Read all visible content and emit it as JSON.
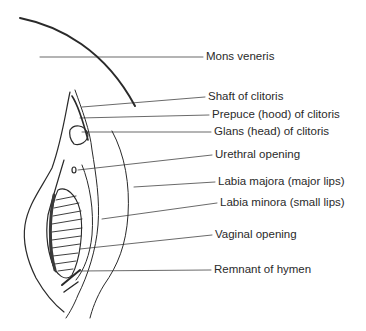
{
  "figure": {
    "type": "anatomical line drawing",
    "line_color": "#2a2a2a",
    "labels": [
      {
        "text": "Mons veneris",
        "x": 206,
        "y": 50
      },
      {
        "text": "Shaft of clitoris",
        "x": 208,
        "y": 90
      },
      {
        "text": "Prepuce (hood) of clitoris",
        "x": 212,
        "y": 108
      },
      {
        "text": "Glans (head) of clitoris",
        "x": 214,
        "y": 125
      },
      {
        "text": "Urethral opening",
        "x": 215,
        "y": 148
      },
      {
        "text": "Labia majora (major lips)",
        "x": 218,
        "y": 175
      },
      {
        "text": "Labia minora (small lips)",
        "x": 220,
        "y": 196
      },
      {
        "text": "Vaginal opening",
        "x": 215,
        "y": 228
      },
      {
        "text": "Remnant of hymen",
        "x": 214,
        "y": 263
      }
    ]
  }
}
